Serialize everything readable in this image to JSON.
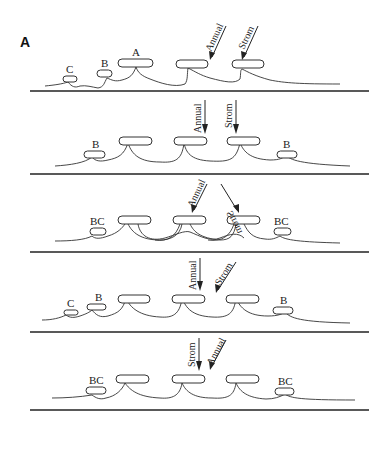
{
  "figure": {
    "panel_label": "A",
    "panels": [
      {
        "id": 1,
        "switch_labels": [
          "C",
          "B",
          "A"
        ],
        "arrows": [
          {
            "label": "Annual",
            "direction": "diagonal"
          },
          {
            "label": "Strom",
            "direction": "diagonal"
          }
        ]
      },
      {
        "id": 2,
        "switch_labels": [
          "B",
          "B"
        ],
        "arrows": [
          {
            "label": "Annual",
            "direction": "vertical"
          },
          {
            "label": "Strom",
            "direction": "vertical"
          }
        ]
      },
      {
        "id": 3,
        "switch_labels": [
          "BC",
          "BC"
        ],
        "arrows": [
          {
            "label": "Annual",
            "direction": "diagonal"
          },
          {
            "label": "Strom",
            "direction": "diagonal-mirrored"
          }
        ]
      },
      {
        "id": 4,
        "switch_labels": [
          "C",
          "B",
          "B"
        ],
        "arrows": [
          {
            "label": "Annual",
            "direction": "vertical"
          },
          {
            "label": "Strom",
            "direction": "diagonal"
          }
        ]
      },
      {
        "id": 5,
        "switch_labels": [
          "BC",
          "BC"
        ],
        "arrows": [
          {
            "label": "Strom",
            "direction": "vertical"
          },
          {
            "label": "Annual",
            "direction": "diagonal"
          }
        ]
      }
    ]
  }
}
